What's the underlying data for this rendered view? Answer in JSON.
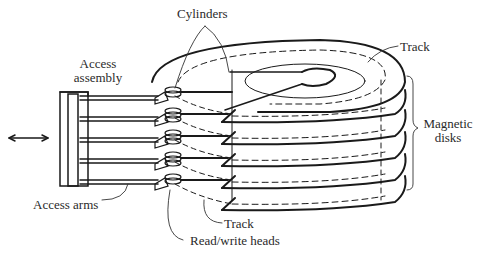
{
  "diagram": {
    "stroke_color": "#1a1a1a",
    "labels": {
      "cylinders": "Cylinders",
      "track_top": "Track",
      "access_assembly_line1": "Access",
      "access_assembly_line2": "assembly",
      "magnetic_disks_line1": "Magnetic",
      "magnetic_disks_line2": "disks",
      "access_arms": "Access arms",
      "track_bottom": "Track",
      "read_write_heads": "Read/write heads"
    },
    "disk_count": 6,
    "arm_count": 5,
    "motion_arrow": "bidirectional-horizontal"
  }
}
